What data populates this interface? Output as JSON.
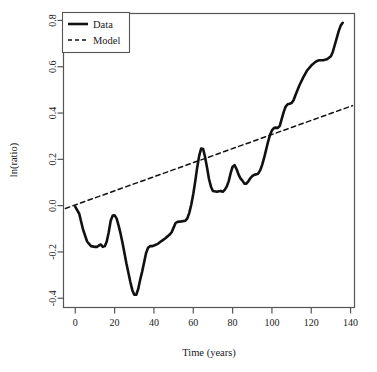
{
  "chart_data": {
    "type": "line",
    "title": "",
    "xlabel": "Time (years)",
    "ylabel": "ln(ratio)",
    "xlim": [
      -6,
      142
    ],
    "ylim": [
      -0.44,
      0.83
    ],
    "xticks": [
      0,
      20,
      40,
      60,
      80,
      100,
      120,
      140
    ],
    "xtick_labels": [
      "0",
      "20",
      "40",
      "60",
      "80",
      "100",
      "120",
      "140"
    ],
    "yticks": [
      -0.4,
      -0.2,
      0.0,
      0.2,
      0.4,
      0.6,
      0.8
    ],
    "ytick_labels": [
      "-0.4",
      "-0.2",
      "0.0",
      "0.2",
      "0.4",
      "0.6",
      "0.8"
    ],
    "grid": false,
    "legend_position": "top-left",
    "series": [
      {
        "name": "Data",
        "style": "solid",
        "color": "#111111",
        "width": 2.6,
        "x": [
          0,
          2,
          4,
          6,
          8,
          10,
          11,
          12,
          13,
          14,
          15,
          16,
          17,
          18,
          19,
          20,
          21,
          22,
          23,
          24,
          25,
          26,
          27,
          28,
          29,
          30,
          31,
          32,
          33,
          34,
          35,
          36,
          37,
          38,
          39,
          40,
          42,
          44,
          46,
          48,
          49,
          50,
          51,
          52,
          54,
          56,
          57,
          58,
          59,
          60,
          61,
          62,
          63,
          64,
          65,
          66,
          67,
          68,
          69,
          70,
          72,
          73,
          74,
          75,
          76,
          77,
          78,
          79,
          80,
          81,
          82,
          83,
          84,
          85,
          86,
          87,
          88,
          89,
          90,
          91,
          92,
          93,
          94,
          95,
          96,
          97,
          98,
          99,
          100,
          101,
          102,
          103,
          104,
          105,
          106,
          107,
          108,
          109,
          110,
          111,
          112,
          114,
          116,
          118,
          120,
          122,
          123,
          124,
          126,
          128,
          130,
          131,
          132,
          133,
          134,
          135,
          136
        ],
        "y": [
          -0.005,
          -0.035,
          -0.105,
          -0.155,
          -0.175,
          -0.178,
          -0.178,
          -0.172,
          -0.168,
          -0.178,
          -0.175,
          -0.155,
          -0.115,
          -0.065,
          -0.043,
          -0.042,
          -0.055,
          -0.085,
          -0.12,
          -0.16,
          -0.205,
          -0.25,
          -0.29,
          -0.33,
          -0.365,
          -0.385,
          -0.385,
          -0.36,
          -0.32,
          -0.285,
          -0.245,
          -0.205,
          -0.182,
          -0.175,
          -0.175,
          -0.172,
          -0.165,
          -0.152,
          -0.14,
          -0.125,
          -0.115,
          -0.095,
          -0.075,
          -0.07,
          -0.068,
          -0.065,
          -0.055,
          -0.03,
          0.005,
          0.05,
          0.105,
          0.165,
          0.215,
          0.247,
          0.245,
          0.21,
          0.165,
          0.115,
          0.082,
          0.063,
          0.06,
          0.062,
          0.063,
          0.06,
          0.068,
          0.082,
          0.105,
          0.14,
          0.168,
          0.175,
          0.158,
          0.135,
          0.118,
          0.108,
          0.095,
          0.095,
          0.105,
          0.118,
          0.128,
          0.133,
          0.135,
          0.138,
          0.152,
          0.175,
          0.205,
          0.24,
          0.275,
          0.305,
          0.325,
          0.335,
          0.337,
          0.336,
          0.345,
          0.375,
          0.405,
          0.428,
          0.438,
          0.44,
          0.443,
          0.455,
          0.478,
          0.52,
          0.555,
          0.585,
          0.605,
          0.62,
          0.625,
          0.628,
          0.628,
          0.632,
          0.645,
          0.665,
          0.695,
          0.725,
          0.755,
          0.778,
          0.79
        ]
      },
      {
        "name": "Model",
        "style": "dashed",
        "color": "#111111",
        "width": 1.5,
        "x": [
          -5,
          141
        ],
        "y": [
          -0.012,
          0.432
        ]
      }
    ]
  },
  "legend": {
    "entries": [
      {
        "label": "Data",
        "style": "solid"
      },
      {
        "label": "Model",
        "style": "dashed"
      }
    ]
  }
}
